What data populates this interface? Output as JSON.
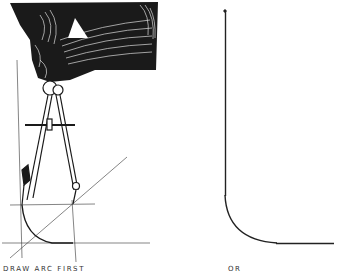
{
  "figure": {
    "left_panel": {
      "caption": "DRAW ARC FIRST",
      "subject": "hand holding compass drawing arc tangent to construction lines"
    },
    "right_panel": {
      "caption": "OR",
      "subject": "vertical line joined to horizontal line by tangent arc"
    },
    "colors": {
      "ink": "#1a1a1a",
      "paper": "#ffffff"
    }
  }
}
